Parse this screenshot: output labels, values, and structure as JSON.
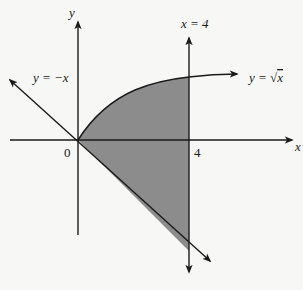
{
  "diagram": {
    "type": "region-between-curves",
    "colors": {
      "background": "#f7f7f5",
      "stroke": "#1a1a1a",
      "region_fill": "#8c8c8c"
    },
    "axes": {
      "x_label": "x",
      "y_label": "y",
      "origin_label": "0",
      "x_tick_label": "4"
    },
    "curves": [
      {
        "id": "sqrt",
        "label_prefix": "y = ",
        "label_radical": "√",
        "label_var": "x",
        "expression": "y = sqrt(x)"
      },
      {
        "id": "neg",
        "label": "y = −x",
        "expression": "y = -x"
      },
      {
        "id": "vert",
        "label": "x = 4",
        "expression": "x = 4"
      }
    ],
    "shaded_region": {
      "description": "Region bounded by y = sqrt(x) above, y = -x below, from x = 0 to x = 4"
    }
  }
}
